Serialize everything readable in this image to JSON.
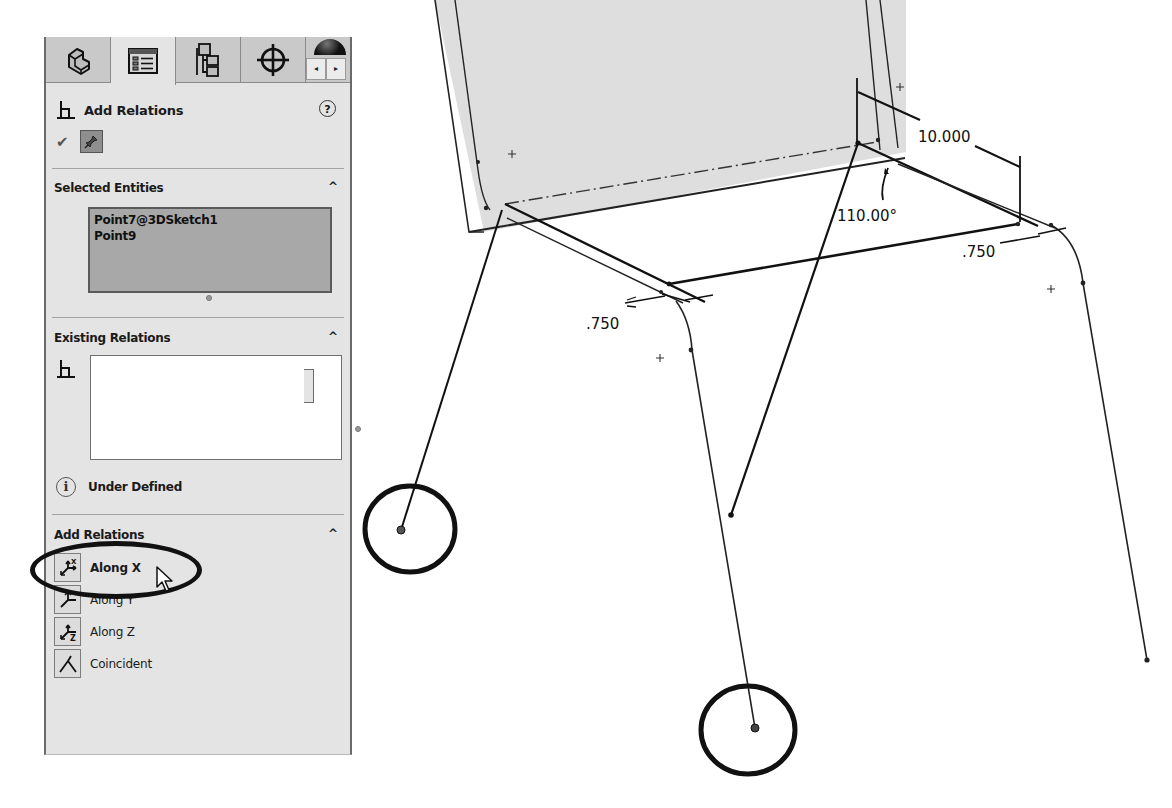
{
  "panel": {
    "tabs": [
      {
        "name": "feature-manager-tab",
        "icon": "part-icon",
        "active": false
      },
      {
        "name": "property-manager-tab",
        "icon": "property-list-icon",
        "active": true
      },
      {
        "name": "configuration-manager-tab",
        "icon": "configuration-tree-icon",
        "active": false
      },
      {
        "name": "dimxpert-manager-tab",
        "icon": "crosshair-icon",
        "active": false
      },
      {
        "name": "display-manager-tab",
        "icon": "appearance-dome-icon",
        "active": false
      }
    ],
    "tab_scroll": {
      "left": "◂",
      "right": "▸"
    },
    "header": {
      "title": "Add Relations",
      "help": "?"
    },
    "confirm": {
      "ok": "✔"
    },
    "selected_entities": {
      "title": "Selected Entities",
      "items": [
        "Point7@3DSketch1",
        "Point9"
      ]
    },
    "existing_relations": {
      "title": "Existing Relations",
      "items": []
    },
    "status": {
      "text": "Under Defined",
      "icon": "info-icon"
    },
    "add_relations": {
      "title": "Add Relations",
      "items": [
        {
          "label": "Along X",
          "icon": "along-x-icon",
          "highlighted": true
        },
        {
          "label": "Along Y",
          "icon": "along-y-icon",
          "highlighted": false
        },
        {
          "label": "Along Z",
          "icon": "along-z-icon",
          "highlighted": false
        },
        {
          "label": "Coincident",
          "icon": "coincident-icon",
          "highlighted": false
        }
      ]
    },
    "collapse_glyph": "^"
  },
  "graphics": {
    "dimensions": {
      "length": "10.000",
      "angle": "110.00°",
      "fillet_left": ".750",
      "fillet_right": ".750"
    },
    "annotations": {
      "selected_points_circled": 2
    }
  },
  "colors": {
    "panel_bg": "#e4e4e4",
    "tab_bg": "#c9c9c9",
    "selection_bg": "#a8a8a8",
    "plane_fill": "#dedede",
    "sketch_line": "#111111"
  }
}
